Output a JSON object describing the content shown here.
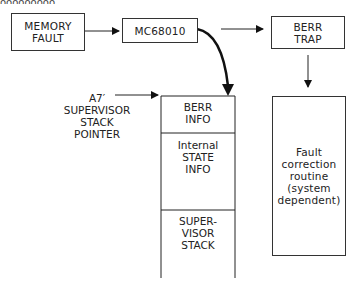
{
  "figure": {
    "cut_top_text": "ooooooooo",
    "memory_fault": "MEMORY\nFAULT",
    "cpu": "MC68010",
    "berr_trap": "BERR\nTRAP",
    "sp_label": "A7′\nSUPERVISOR\nSTACK\nPOINTER",
    "stack": {
      "berr_info": "BERR\nINFO",
      "internal_state": "Internal\nSTATE\nINFO",
      "supervisor_stack": "SUPER-\nVISOR\nSTACK"
    },
    "fault_routine": "Fault\ncorrection\nroutine\n(system\ndependent)"
  }
}
